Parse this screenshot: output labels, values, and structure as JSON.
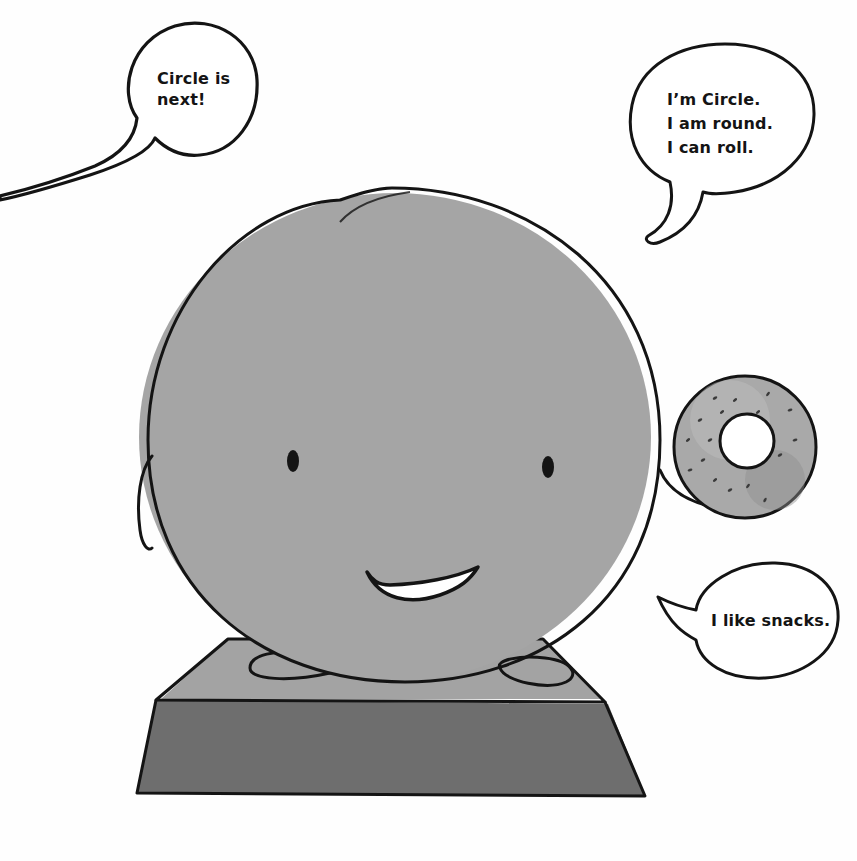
{
  "scene": {
    "colors": {
      "background": "#fefefe",
      "circle_fill": "#a5a5a5",
      "outline": "#141414",
      "platform_top": "#a3a3a3",
      "platform_front": "#6f6f6f",
      "donut": "#a9a9a9",
      "mouth_fill": "#ffffff"
    },
    "bubbles": {
      "announcer": {
        "lines": [
          "Circle is",
          "next!"
        ]
      },
      "circle_intro": {
        "lines": [
          "I’m Circle.",
          "I am round.",
          "I can roll."
        ]
      },
      "circle_snacks": {
        "lines": [
          "I like snacks."
        ]
      }
    }
  }
}
